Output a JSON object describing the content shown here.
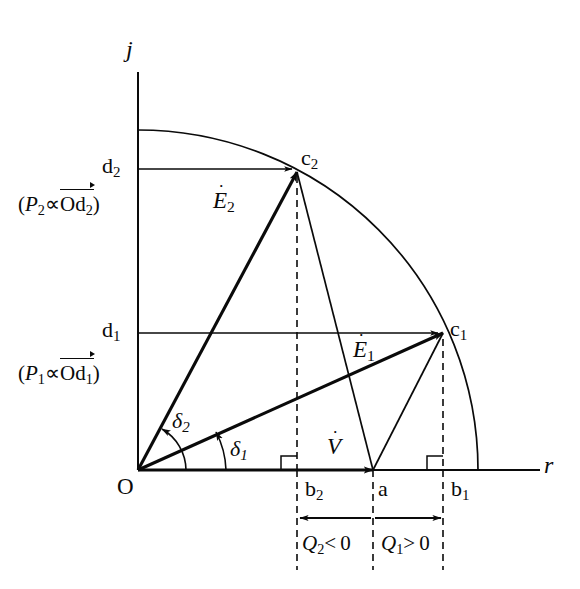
{
  "figure": {
    "type": "phasor-diagram"
  },
  "axes": {
    "vertical_label": "j",
    "horizontal_label": "r",
    "origin_label": "O"
  },
  "points": {
    "c1": "c",
    "c1_sub": "1",
    "c2": "c",
    "c2_sub": "2",
    "d1": "d",
    "d1_sub": "1",
    "d2": "d",
    "d2_sub": "2",
    "a": "a",
    "b1": "b",
    "b1_sub": "1",
    "b2": "b",
    "b2_sub": "2"
  },
  "phasors": {
    "v": "V",
    "e1": "E",
    "e1_sub": "1",
    "e2": "E",
    "e2_sub": "2",
    "dot": "˙"
  },
  "angles": {
    "delta1": "δ",
    "delta1_sub": "1",
    "delta2": "δ",
    "delta2_sub": "2"
  },
  "annotations": {
    "p2_open": "(",
    "p2_sym": "P",
    "p2_sub": "2",
    "p2_prop": "∝",
    "p2_vec": "Od",
    "p2_vec_sub": "2",
    "p2_close": ")",
    "p1_open": "(",
    "p1_sym": "P",
    "p1_sub": "1",
    "p1_prop": "∝",
    "p1_vec": "Od",
    "p1_vec_sub": "1",
    "p1_close": ")",
    "q2_sym": "Q",
    "q2_sub": "2",
    "q2_rel": "< 0",
    "q1_sym": "Q",
    "q1_sub": "1",
    "q1_rel": "> 0"
  },
  "geometry": {
    "origin": [
      138,
      470
    ],
    "arc_radius": 340,
    "c1": [
      443,
      333
    ],
    "c2": [
      297,
      172
    ],
    "a": [
      373,
      470
    ],
    "b1": [
      443,
      470
    ],
    "b2": [
      297,
      470
    ],
    "j_axis_top": 72,
    "r_axis_right": 540
  },
  "colors": {
    "ink": "#0a0a0a",
    "background": "#ffffff"
  }
}
